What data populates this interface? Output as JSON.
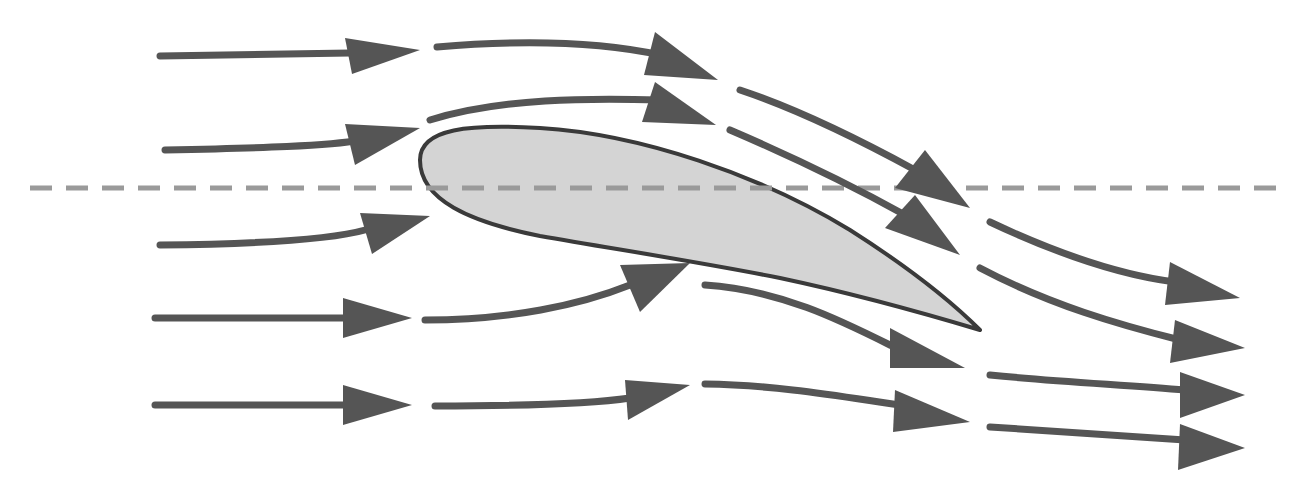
{
  "diagram": {
    "width": 1312,
    "height": 495,
    "colors": {
      "background": "#ffffff",
      "arrow": "#555555",
      "airfoil_fill": "#d4d4d4",
      "airfoil_stroke": "#3a3a3a",
      "chord_line": "#9a9a9a"
    },
    "chord_line": {
      "x1": 30,
      "y1": 188,
      "x2": 1290,
      "y2": 188,
      "dash": "22 14",
      "width": 5
    },
    "airfoil": {
      "path": "M 420 160 C 420 128 470 124 540 128 C 640 134 760 175 850 230 C 905 265 950 300 980 330 C 930 315 860 295 780 278 C 700 262 620 250 540 236 C 470 222 420 200 420 160 Z"
    },
    "arrows": [
      {
        "name": "row1-seg1",
        "path": "M 160 56 C 250 55 320 54 350 53",
        "head": [
          [
            345,
            38
          ],
          [
            420,
            50
          ],
          [
            352,
            74
          ]
        ]
      },
      {
        "name": "row1-seg2",
        "path": "M 437 47 C 520 40 600 42 660 55",
        "head": [
          [
            655,
            32
          ],
          [
            718,
            80
          ],
          [
            644,
            75
          ]
        ]
      },
      {
        "name": "row1-seg3",
        "path": "M 740 90 C 800 110 860 140 915 170",
        "head": [
          [
            925,
            150
          ],
          [
            970,
            208
          ],
          [
            895,
            188
          ]
        ]
      },
      {
        "name": "row2-seg1",
        "path": "M 165 150 C 260 148 330 146 360 140",
        "head": [
          [
            345,
            124
          ],
          [
            420,
            128
          ],
          [
            355,
            165
          ]
        ]
      },
      {
        "name": "row2-seg2",
        "path": "M 430 120 C 500 98 590 98 660 100",
        "head": [
          [
            655,
            82
          ],
          [
            716,
            125
          ],
          [
            642,
            122
          ]
        ]
      },
      {
        "name": "row2-seg3",
        "path": "M 730 130 C 800 160 860 190 905 215",
        "head": [
          [
            915,
            195
          ],
          [
            960,
            255
          ],
          [
            885,
            228
          ]
        ]
      },
      {
        "name": "row3-seg1",
        "path": "M 160 245 C 250 244 330 240 365 230",
        "head": [
          [
            360,
            213
          ],
          [
            430,
            216
          ],
          [
            372,
            254
          ]
        ]
      },
      {
        "name": "row3-seg2",
        "path": "M 990 222 C 1060 255 1120 275 1175 282",
        "head": [
          [
            1170,
            262
          ],
          [
            1240,
            298
          ],
          [
            1165,
            305
          ]
        ]
      },
      {
        "name": "row4-seg1",
        "path": "M 155 318 C 250 318 320 318 350 318",
        "head": [
          [
            343,
            298
          ],
          [
            412,
            318
          ],
          [
            343,
            338
          ]
        ]
      },
      {
        "name": "row4-seg2",
        "path": "M 425 320 C 510 320 580 305 630 285",
        "head": [
          [
            620,
            265
          ],
          [
            690,
            263
          ],
          [
            640,
            312
          ]
        ]
      },
      {
        "name": "row4-seg3",
        "path": "M 705 285 C 780 290 840 320 890 345",
        "head": [
          [
            890,
            328
          ],
          [
            965,
            368
          ],
          [
            890,
            368
          ]
        ]
      },
      {
        "name": "row4-seg4",
        "path": "M 980 268 C 1050 305 1120 325 1180 340",
        "head": [
          [
            1175,
            320
          ],
          [
            1245,
            348
          ],
          [
            1170,
            363
          ]
        ]
      },
      {
        "name": "row5-seg1",
        "path": "M 155 405 C 250 405 320 405 350 405",
        "head": [
          [
            343,
            385
          ],
          [
            412,
            405
          ],
          [
            343,
            425
          ]
        ]
      },
      {
        "name": "row5-seg2",
        "path": "M 435 406 C 520 406 590 404 630 398",
        "head": [
          [
            625,
            380
          ],
          [
            690,
            385
          ],
          [
            628,
            420
          ]
        ]
      },
      {
        "name": "row5-seg3",
        "path": "M 705 384 C 780 385 850 398 900 405",
        "head": [
          [
            895,
            390
          ],
          [
            970,
            422
          ],
          [
            893,
            432
          ]
        ]
      },
      {
        "name": "row5-seg4",
        "path": "M 990 375 C 1060 382 1130 385 1185 390",
        "head": [
          [
            1180,
            372
          ],
          [
            1245,
            395
          ],
          [
            1180,
            418
          ]
        ]
      },
      {
        "name": "row6-seg4",
        "path": "M 990 427 C 1060 432 1130 436 1185 440",
        "head": [
          [
            1180,
            424
          ],
          [
            1245,
            448
          ],
          [
            1178,
            470
          ]
        ]
      }
    ]
  }
}
